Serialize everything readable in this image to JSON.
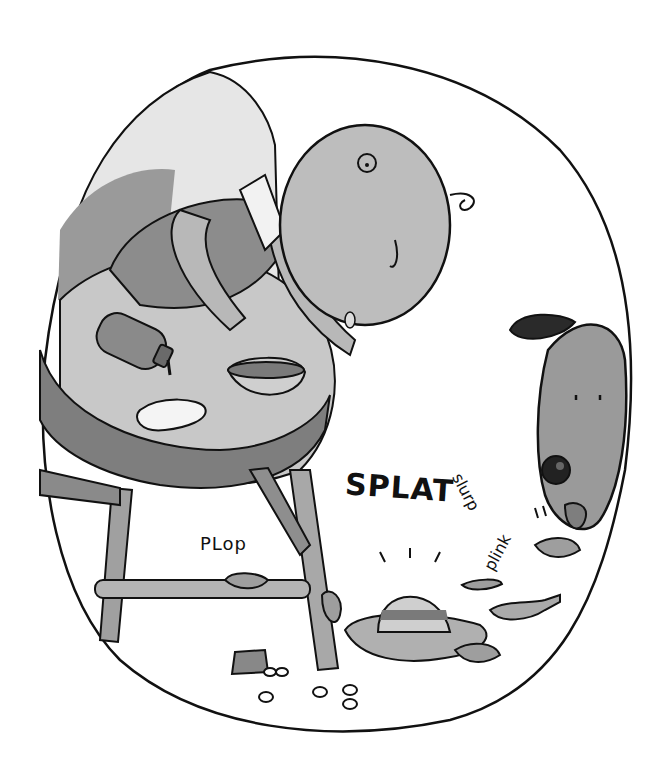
{
  "illustration": {
    "description": "Grayscale cartoon of a baby in a high chair spilling food; a dog licks the mess on the floor",
    "sound_effects": {
      "splat": "SPLAT",
      "plop": "PLop",
      "slurp": "slurp",
      "plink": "plink"
    },
    "colors": {
      "background": "#ffffff",
      "outline": "#111111",
      "light_gray": "#d6d6d6",
      "mid_gray": "#a8a8a8",
      "dark_gray": "#7a7a7a",
      "shadow": "#5a5a5a"
    }
  }
}
